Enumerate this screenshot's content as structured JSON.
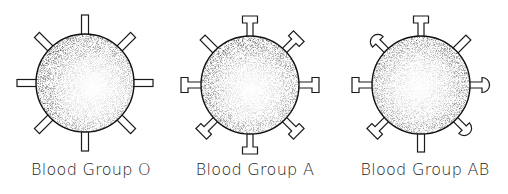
{
  "diagram": {
    "type": "blood-group-antigen-illustration",
    "colors": {
      "outline": "#1a1a1a",
      "cell_center": "#ffffff",
      "cell_edge": "#2a2a2a",
      "background": "#ffffff"
    },
    "antigen_legend": {
      "plain": "plain rectangular stub (no antigen)",
      "A": "T-shaped antigen",
      "B": "rounded-cap antigen"
    },
    "cells": [
      {
        "id": "O",
        "label": "Blood Group O",
        "antigens": [
          "plain",
          "plain",
          "plain",
          "plain",
          "plain",
          "plain",
          "plain",
          "plain"
        ]
      },
      {
        "id": "A",
        "label": "Blood Group A",
        "antigens": [
          "A",
          "A",
          "A",
          "A",
          "A",
          "A",
          "A",
          "A"
        ]
      },
      {
        "id": "AB",
        "label": "Blood Group AB",
        "antigens": [
          "A",
          "plain",
          "B",
          "B",
          "plain",
          "A",
          "A",
          "B"
        ]
      }
    ]
  }
}
